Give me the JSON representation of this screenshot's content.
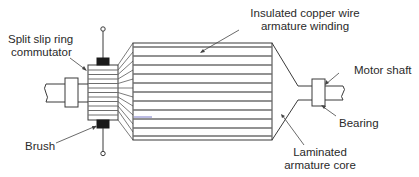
{
  "diagram": {
    "labels": {
      "commutator_line1": "Split slip ring",
      "commutator_line2": "commutator",
      "winding_line1": "Insulated copper wire",
      "winding_line2": "armature winding",
      "shaft": "Motor shaft",
      "bearing": "Bearing",
      "brush": "Brush",
      "core_line1": "Laminated",
      "core_line2": "armature core"
    },
    "colors": {
      "stroke": "#3a3a3a",
      "stripe": "#6e6e6e",
      "brush_fill": "#1a1a1a",
      "accent_line": "#7b7bc8"
    }
  }
}
